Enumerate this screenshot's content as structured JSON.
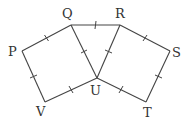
{
  "diagram": {
    "points": {
      "P": {
        "label": "P",
        "x": 22,
        "y": 51
      },
      "Q": {
        "label": "Q",
        "x": 71,
        "y": 25
      },
      "R": {
        "label": "R",
        "x": 120,
        "y": 25
      },
      "S": {
        "label": "S",
        "x": 170,
        "y": 51
      },
      "T": {
        "label": "T",
        "x": 146,
        "y": 102
      },
      "U": {
        "label": "U",
        "x": 97,
        "y": 78
      },
      "V": {
        "label": "V",
        "x": 45,
        "y": 102
      }
    },
    "segments": [
      [
        "P",
        "Q"
      ],
      [
        "Q",
        "U"
      ],
      [
        "U",
        "V"
      ],
      [
        "V",
        "P"
      ],
      [
        "Q",
        "R"
      ],
      [
        "R",
        "U"
      ],
      [
        "R",
        "S"
      ],
      [
        "S",
        "T"
      ],
      [
        "T",
        "U"
      ]
    ],
    "equal_marks": "single tick on every segment"
  }
}
